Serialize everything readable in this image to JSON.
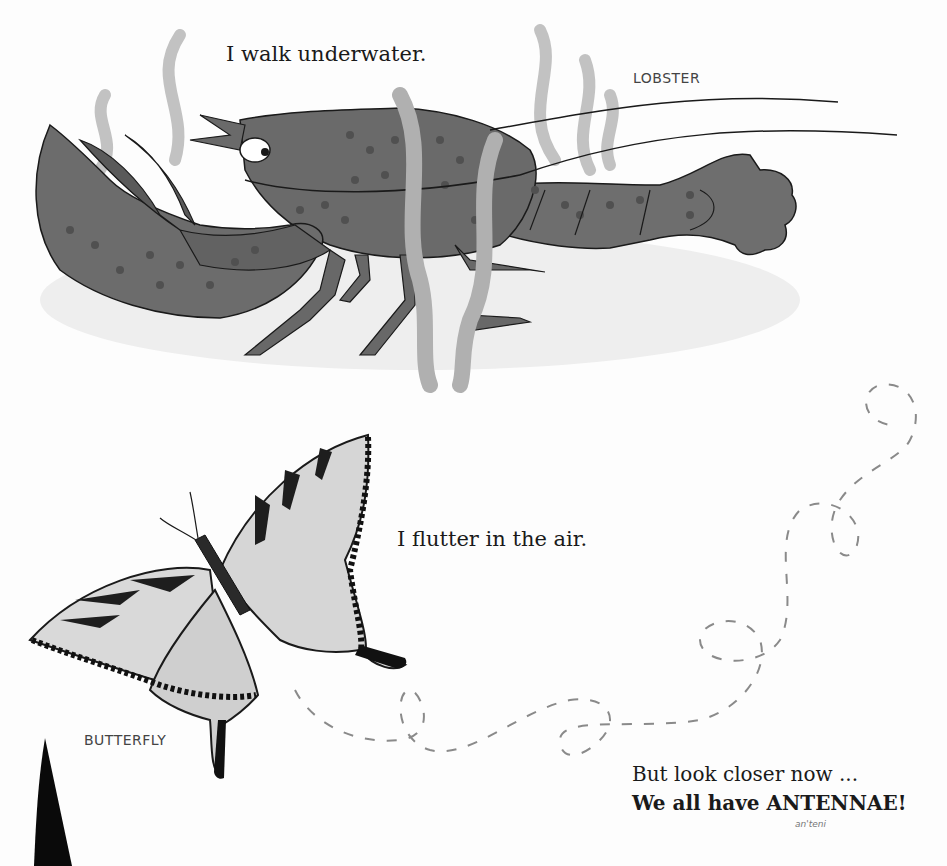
{
  "page": {
    "lobster": {
      "caption": "I walk underwater.",
      "label": "LOBSTER"
    },
    "butterfly": {
      "caption": "I flutter in the air.",
      "label": "BUTTERFLY"
    },
    "closing": {
      "line1": "But look closer now ...",
      "line2": "We all have ANTENNAE!",
      "pronunciation": "an'teni"
    },
    "colors": {
      "lobster_body": "#6e6e6e",
      "lobster_spots": "#4f4f4f",
      "seaweed": "#b3b3b3",
      "shadow": "#ececec",
      "butterfly_wing": "#d9d9d9",
      "butterfly_stripe": "#1e1e1e",
      "flight_path": "#8a8a8a",
      "text": "#1a1a1a"
    }
  }
}
